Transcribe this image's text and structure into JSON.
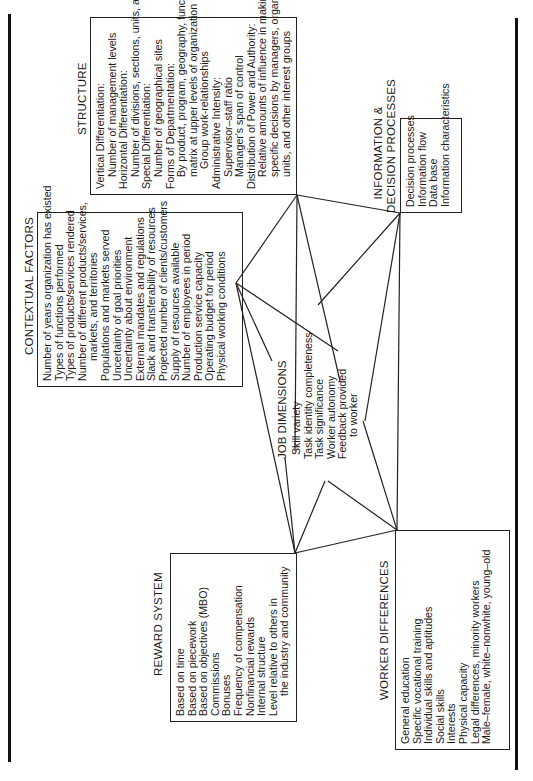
{
  "diagram": {
    "center": {
      "title": "JOB DIMENSIONS",
      "items": [
        "Skill variety",
        "Task identity completeness",
        "Task significance",
        "Worker autonomy",
        "Feedback provided",
        "to worker"
      ]
    },
    "contextual_factors": {
      "title": "CONTEXTUAL FACTORS",
      "items": [
        "Number of years organization has existed",
        "Types of functions performed",
        "Types of products/services rendered",
        "Number of different products/services,",
        "markets, and territories",
        "Populations and markets served",
        "Uncertainty of goal priorities",
        "Uncertainty about environment",
        "External mandates and regulations",
        "Slack and transferability of resources",
        "Projected number of clients/customers",
        "Supply of resources available",
        "Number of employees in period",
        "Production service capacity",
        "Operating budget for period",
        "Physical working conditions"
      ]
    },
    "structure": {
      "title": "STRUCTURE",
      "items": [
        "Vertical Differentiation:",
        "Number of management levels",
        "Horizontal Differentiation:",
        "Number of divisions, sections, units, and job titles",
        "Special Differentiation:",
        "Number of geographical sites",
        "Forms of Departmentation:",
        "By product, program, geography, function",
        "matrix at upper levels of organization",
        "Group work-relationships",
        "Administrative Intensity:",
        "Supervisor–staff ratio",
        "Manager's span of control",
        "Distribution of Power and Authority:",
        "Relative amounts of influence in making",
        "specific decisions by managers, organizational",
        "units, and other interest groups"
      ]
    },
    "information": {
      "title_line1": "INFORMATION &",
      "title_line2": "DECISION PROCESSES",
      "items": [
        "Decision processes",
        "Information flow",
        "Data base",
        "Information characteristics"
      ]
    },
    "reward_system": {
      "title": "REWARD SYSTEM",
      "items": [
        "Based on time",
        "Based on piecework",
        "Based on objectives (MBO)",
        "Commissions",
        "Bonuses",
        "Frequency of compensation",
        "Nonfinancial rewards",
        "Internal structure",
        "Level relative to others in",
        "the industry and community"
      ]
    },
    "worker_differences": {
      "title": "WORKER DIFFERENCES",
      "items": [
        "General education",
        "Specific vocational training",
        "Individual skills and aptitudes",
        "Social skills",
        "Interests",
        "Physical capacity",
        "Legal differences, minority workers",
        "Male–female, white–nonwhite, young–old"
      ]
    }
  }
}
